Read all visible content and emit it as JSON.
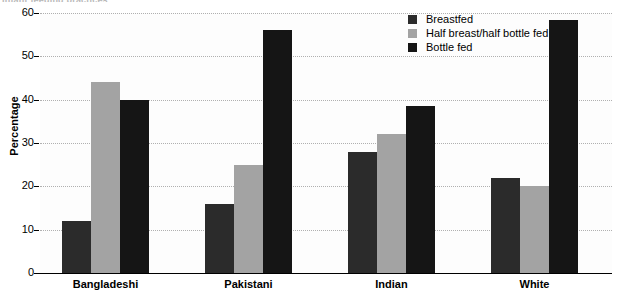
{
  "title_clip": "Infant feeding practices",
  "chart_data": {
    "type": "bar",
    "title": "",
    "xlabel": "",
    "ylabel": "Percentage",
    "ylim": [
      0,
      60
    ],
    "ytick_step": 10,
    "yticks": [
      "0",
      "10",
      "20",
      "30",
      "40",
      "50",
      "60"
    ],
    "grid": true,
    "legend_position": "top-right",
    "categories": [
      "Bangladeshi",
      "Pakistani",
      "Indian",
      "White"
    ],
    "series": [
      {
        "name": "Breastfed",
        "color": "#2b2b2b",
        "values": [
          12,
          16,
          28,
          22
        ]
      },
      {
        "name": "Half breast/half bottle fed",
        "color": "#a3a3a3",
        "values": [
          44,
          25,
          32,
          20
        ]
      },
      {
        "name": "Bottle fed",
        "color": "#151515",
        "values": [
          40,
          56,
          38.5,
          58.5
        ]
      }
    ]
  }
}
